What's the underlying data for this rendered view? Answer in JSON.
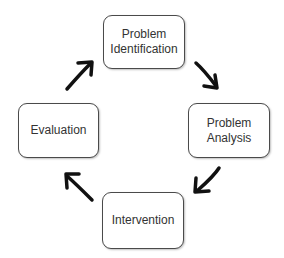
{
  "diagram": {
    "type": "cycle",
    "nodes": [
      {
        "id": "identification",
        "lines": [
          "Problem",
          "Identification"
        ]
      },
      {
        "id": "analysis",
        "lines": [
          "Problem",
          "Analysis"
        ]
      },
      {
        "id": "intervention",
        "lines": [
          "Intervention"
        ]
      },
      {
        "id": "evaluation",
        "lines": [
          "Evaluation"
        ]
      }
    ],
    "edges": [
      {
        "from": "identification",
        "to": "analysis"
      },
      {
        "from": "analysis",
        "to": "intervention"
      },
      {
        "from": "intervention",
        "to": "evaluation"
      },
      {
        "from": "evaluation",
        "to": "identification"
      }
    ],
    "colors": {
      "box_border": "#4a4a4a",
      "text": "#333333",
      "arrow": "#111111",
      "background": "#ffffff"
    }
  }
}
